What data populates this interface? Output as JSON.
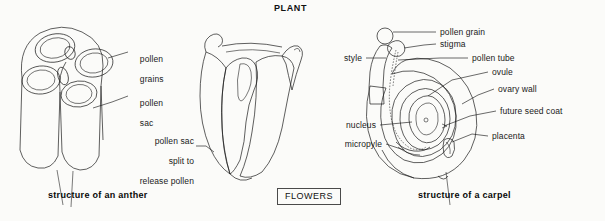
{
  "page": {
    "title": "PLANT",
    "background_color": "#fbfbf9",
    "ink_color": "#1b1b1b"
  },
  "tag": {
    "label": "FLOWERS"
  },
  "figures": [
    {
      "id": "anther-cross-section",
      "caption": "structure of an anther",
      "labels": [
        {
          "name": "pollen-grains",
          "text": "pollen\ngrains"
        },
        {
          "name": "pollen-sac",
          "text": "pollen\nsac"
        }
      ]
    },
    {
      "id": "dehisced-anther",
      "caption": "",
      "labels": [
        {
          "name": "pollen-sac-split",
          "text": "pollen sac\nsplit to\nrelease pollen"
        }
      ]
    },
    {
      "id": "carpel",
      "caption": "structure of a carpel",
      "labels": [
        {
          "name": "pollen-grain",
          "text": "pollen grain"
        },
        {
          "name": "stigma",
          "text": "stigma"
        },
        {
          "name": "pollen-tube",
          "text": "pollen tube"
        },
        {
          "name": "ovule",
          "text": "ovule"
        },
        {
          "name": "ovary-wall",
          "text": "ovary wall"
        },
        {
          "name": "future-seed-coat",
          "text": "future seed coat"
        },
        {
          "name": "placenta",
          "text": "placenta"
        },
        {
          "name": "style",
          "text": "style"
        },
        {
          "name": "nucleus",
          "text": "nucleus"
        },
        {
          "name": "micropyle",
          "text": "micropyle"
        }
      ]
    }
  ],
  "label_text": {
    "pollen_grains_l1": "pollen",
    "pollen_grains_l2": "grains",
    "pollen_sac_l1": "pollen",
    "pollen_sac_l2": "sac",
    "split_l1": "pollen sac",
    "split_l2": "split to",
    "split_l3": "release pollen",
    "pollen_grain": "pollen grain",
    "stigma": "stigma",
    "pollen_tube": "pollen tube",
    "ovule": "ovule",
    "ovary_wall": "ovary wall",
    "future_seed_coat": "future seed coat",
    "placenta": "placenta",
    "style": "style",
    "nucleus": "nucleus",
    "micropyle": "micropyle",
    "caption_anther": "structure of an anther",
    "caption_carpel": "structure of a carpel"
  }
}
